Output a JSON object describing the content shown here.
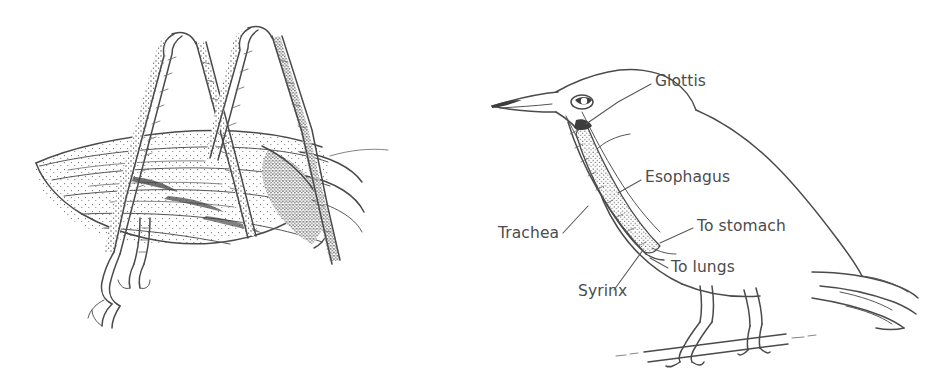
{
  "figure": {
    "background_color": "#ffffff",
    "ink_color": "#4a4a4a",
    "label_color": "#4c4c4c",
    "panels": [
      {
        "id": "left-panel",
        "name": "grasshopper-line-drawing",
        "subject": "grasshopper",
        "description": "Pen-and-ink stippled line drawing of a grasshopper showing folded wings and two raised hind legs forming inverted V shapes",
        "labels": []
      },
      {
        "id": "right-panel",
        "name": "bird-respiratory-anatomy-diagram",
        "subject": "bird",
        "description": "Pen-and-ink line drawing of a perching bird in left profile with cutaway showing trachea and esophagus, annotated with six leader-line labels",
        "labels": [
          {
            "id": "glottis",
            "text": "Glottis",
            "x": 655,
            "y": 86,
            "anchor": "start"
          },
          {
            "id": "esophagus",
            "text": "Esophagus",
            "x": 645,
            "y": 182,
            "anchor": "start"
          },
          {
            "id": "trachea",
            "text": "Trachea",
            "x": 498,
            "y": 238,
            "anchor": "start"
          },
          {
            "id": "to-stomach",
            "text": "To stomach",
            "x": 697,
            "y": 231,
            "anchor": "start"
          },
          {
            "id": "to-lungs",
            "text": "To lungs",
            "x": 671,
            "y": 272,
            "anchor": "start"
          },
          {
            "id": "syrinx",
            "text": "Syrinx",
            "x": 578,
            "y": 296,
            "anchor": "start"
          }
        ]
      }
    ]
  }
}
